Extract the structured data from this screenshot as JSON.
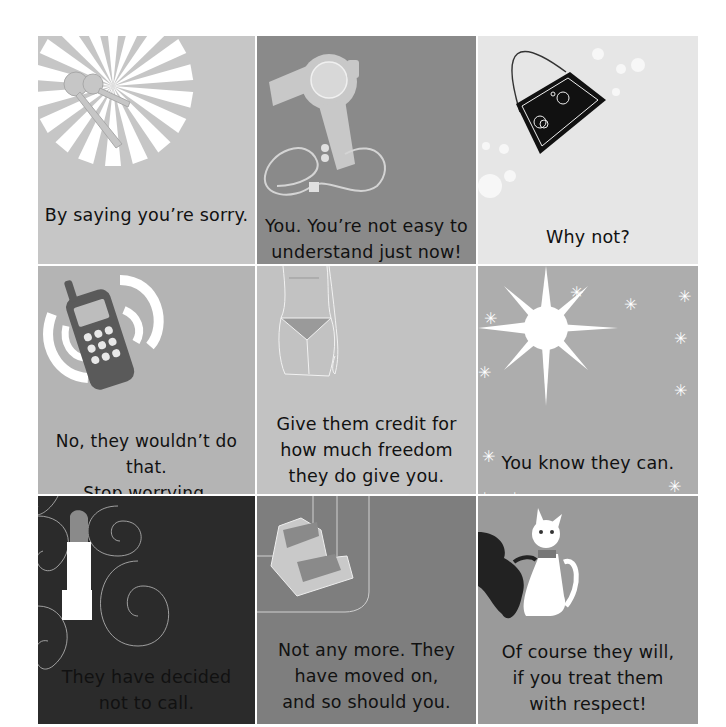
{
  "cards": [
    {
      "id": "keys",
      "bg": "#c6c6c6",
      "caption": "By saying you’re sorry.",
      "icon": "keys-sunburst-icon"
    },
    {
      "id": "hairdryer",
      "bg": "#8a8a8a",
      "caption_lines": [
        "You. You’re not easy to",
        "understand just now!"
      ],
      "icon": "hair-dryer-icon"
    },
    {
      "id": "handbag",
      "bg": "#e6e6e6",
      "caption": "Why not?",
      "icon": "handbag-icon"
    },
    {
      "id": "phone",
      "bg": "#b4b4b4",
      "caption_lines": [
        "No, they wouldn’t do that.",
        "Stop worrying."
      ],
      "icon": "mobile-phone-icon"
    },
    {
      "id": "body",
      "bg": "#c2c2c2",
      "caption_lines": [
        "Give them credit for",
        "how much freedom",
        "they do give you."
      ],
      "icon": "body-outline-icon"
    },
    {
      "id": "star",
      "bg": "#adadad",
      "caption": "You know they can.",
      "icon": "sparkle-star-icon"
    },
    {
      "id": "lipstick",
      "bg": "#2b2b2b",
      "caption_lines": [
        "They have decided",
        "not to call."
      ],
      "icon": "lipstick-icon"
    },
    {
      "id": "shoe",
      "bg": "#7e7e7e",
      "caption_lines": [
        "Not any more. They",
        "have moved on,",
        "and so should you."
      ],
      "icon": "platform-shoe-icon"
    },
    {
      "id": "cat",
      "bg": "#9a9a9a",
      "caption_lines": [
        "Of course they will,",
        "if you treat them",
        "with respect!"
      ],
      "icon": "cat-icon"
    }
  ]
}
